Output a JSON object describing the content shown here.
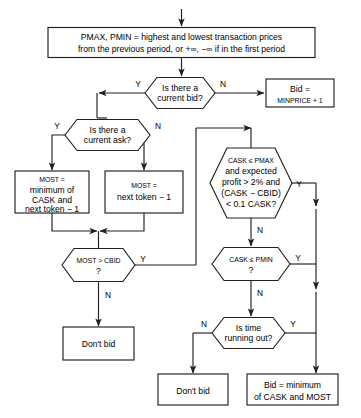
{
  "diagram": {
    "colors": {
      "stroke": "#231f20",
      "fill": "#ffffff",
      "text": "#000000"
    },
    "start": {
      "name": "start-arrow"
    },
    "nodes": {
      "init": {
        "type": "process",
        "line1": "PMAX, PMIN = highest and lowest transaction prices",
        "line2": "from the previous period, or +∞, −∞ if in the first period",
        "l1_a": "PMAX, PMIN",
        "l1_b": " = highest and lowest transaction prices"
      },
      "current_bid": {
        "type": "decision",
        "line1": "Is there a",
        "line2": "current bid?",
        "yes": "Y",
        "no": "N"
      },
      "bid_minprice": {
        "type": "process",
        "line1": "Bid =",
        "line2": "MINPRICE + 1"
      },
      "current_ask": {
        "type": "decision",
        "line1": "Is there a",
        "line2": "current ask?",
        "yes": "Y",
        "no": "N"
      },
      "most_min": {
        "type": "process",
        "line1": "MOST =",
        "line2": "minimum of",
        "line3": "CASK and",
        "line4": "next token − 1"
      },
      "most_next": {
        "type": "process",
        "line1": "MOST =",
        "line2": "next token − 1"
      },
      "cask_pmax": {
        "type": "decision",
        "line1": "CASK ≤ PMAX",
        "line2": "and expected",
        "line3": "profit > 2% and",
        "line4": "(CASK − CBID)",
        "line5": "< 0.1 CASK?",
        "yes": "Y",
        "no": "N"
      },
      "most_cbid": {
        "type": "decision",
        "line1": "MOST > CBID",
        "line2": "?",
        "yes": "Y",
        "no": "N"
      },
      "cask_pmin": {
        "type": "decision",
        "line1": "CASK ≤ PMIN",
        "line2": "?",
        "yes": "Y",
        "no": "N"
      },
      "time_out": {
        "type": "decision",
        "line1": "Is time",
        "line2": "running out?",
        "yes": "Y",
        "no": "N"
      },
      "dont_bid_left": {
        "type": "process",
        "line1": "Don't bid"
      },
      "dont_bid_bottom": {
        "type": "process",
        "line1": "Don't bid"
      },
      "bid_min": {
        "type": "process",
        "line1": "Bid = minimum",
        "line2": "of CASK and MOST"
      }
    }
  }
}
